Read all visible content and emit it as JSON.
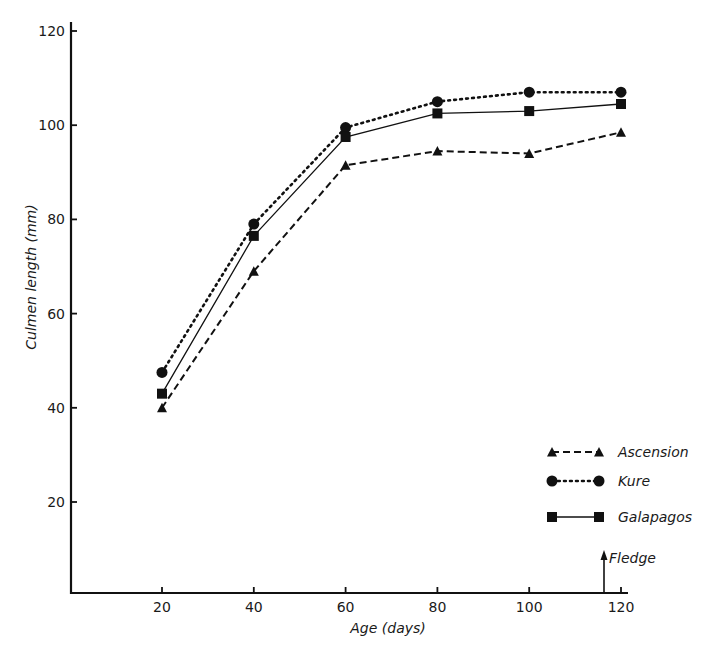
{
  "chart_data": {
    "type": "line",
    "title": "",
    "xlabel": "Age (days)",
    "ylabel": "Culmen length (mm)",
    "x": [
      20,
      40,
      60,
      80,
      100,
      120
    ],
    "xticks": [
      "20",
      "40",
      "60",
      "80",
      "100",
      "120"
    ],
    "yticks": [
      "20",
      "40",
      "60",
      "80",
      "100",
      "120"
    ],
    "xlim": [
      0,
      122
    ],
    "ylim": [
      0,
      122
    ],
    "grid": false,
    "legend_position": "lower right",
    "series": [
      {
        "name": "Ascension",
        "marker": "triangle",
        "linestyle": "dashed",
        "values": [
          40,
          69,
          91.5,
          94.5,
          94,
          98.5
        ]
      },
      {
        "name": "Kure",
        "marker": "circle",
        "linestyle": "dotted",
        "values": [
          47.5,
          79,
          99.5,
          105,
          107,
          107
        ]
      },
      {
        "name": "Galapagos",
        "marker": "square",
        "linestyle": "solid",
        "values": [
          43,
          76.5,
          97.5,
          102.5,
          103,
          104.5
        ]
      }
    ],
    "annotations": [
      {
        "text": "Fledge",
        "x": 116,
        "type": "arrow-up-from-x-axis"
      }
    ]
  },
  "labels": {
    "xlabel": "Age (days)",
    "ylabel": "Culmen length (mm)",
    "fledge": "Fledge"
  },
  "legend": [
    {
      "label": "Ascension"
    },
    {
      "label": "Kure"
    },
    {
      "label": "Galapagos"
    }
  ],
  "colors": {
    "ink": "#111111",
    "background": "#ffffff"
  }
}
